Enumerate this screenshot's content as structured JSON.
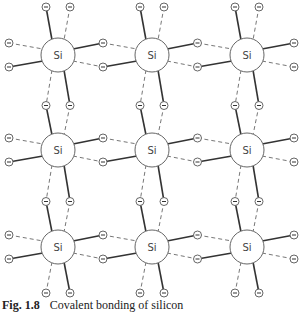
{
  "diagram": {
    "atom_label": "Si",
    "electron_symbol": "−",
    "grid": {
      "columns_x": [
        58,
        152,
        247
      ],
      "rows_y": [
        55,
        150,
        247
      ],
      "atom_radius": 17,
      "electron_radius": 4
    },
    "colors": {
      "line": "#333333",
      "dashed": "#777777",
      "atom_stroke": "#666666",
      "text": "#444444"
    }
  },
  "caption": {
    "figure_number": "Fig. 1.8",
    "text": "Covalent bonding of silicon"
  }
}
